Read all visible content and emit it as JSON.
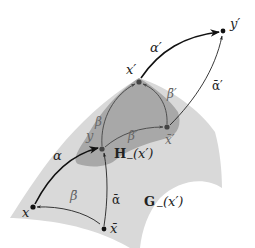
{
  "colors": {
    "background": "#ffffff",
    "region_G": "#d9d9d9",
    "region_H": "#a8a8a8",
    "arrow_black": "#111111",
    "arrow_dark_grey": "#444444",
    "point": "#111111",
    "point_in_H": "#444444"
  },
  "regions": {
    "G": {
      "name": "G",
      "subscript": "−",
      "argument": "(x′)"
    },
    "H": {
      "name": "H",
      "subscript": "−",
      "argument": "(x′)"
    }
  },
  "points": {
    "x": "x",
    "x_bar": "x̄",
    "y": "y",
    "x_prime": "x′",
    "x_bar_prime": "x̄′",
    "y_prime": "y′"
  },
  "arrows": {
    "alpha": "α",
    "alpha_bar": "ᾱ",
    "beta": "β",
    "beta_bar": "β̄",
    "alpha_prime": "α′",
    "alpha_bar_prime": "ᾱ′",
    "beta_prime": "β′",
    "beta_bar_prime": "β̄′"
  }
}
